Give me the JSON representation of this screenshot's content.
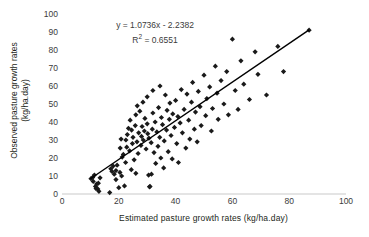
{
  "chart_data": {
    "type": "scatter",
    "title": "",
    "xlabel": "Estimated pasture growth rates (kg/ha.day)",
    "ylabel_line1": "Observed pasture growth rates",
    "ylabel_line2": "(kg/ha.day)",
    "xlim": [
      0,
      100
    ],
    "ylim": [
      0,
      100
    ],
    "xticks": [
      0,
      20,
      40,
      60,
      80,
      100
    ],
    "yticks": [
      0,
      10,
      20,
      30,
      40,
      50,
      60,
      70,
      80,
      90,
      100
    ],
    "grid": false,
    "legend": "none",
    "marker": "diamond",
    "marker_color": "#1a1a1a",
    "annotations": {
      "equation": "y = 1.0736x - 2.2382",
      "r_squared_prefix": "R",
      "r_squared_sup": "2",
      "r_squared_value": " = 0.6551"
    },
    "trendline": {
      "slope": 1.0736,
      "intercept": -2.2382,
      "x_start": 10,
      "x_end": 87,
      "color": "#000000",
      "width": 1.4
    },
    "points": [
      [
        10.2,
        8.5
      ],
      [
        10.8,
        9.2
      ],
      [
        11.0,
        7.0
      ],
      [
        11.4,
        10.5
      ],
      [
        11.8,
        4.2
      ],
      [
        12.0,
        3.0
      ],
      [
        12.2,
        5.5
      ],
      [
        12.6,
        2.8
      ],
      [
        12.8,
        6.0
      ],
      [
        13.0,
        1.5
      ],
      [
        13.4,
        9.0
      ],
      [
        16.8,
        0.8
      ],
      [
        17.2,
        14.0
      ],
      [
        17.6,
        12.5
      ],
      [
        18.0,
        15.5
      ],
      [
        18.4,
        11.0
      ],
      [
        19.0,
        13.0
      ],
      [
        19.4,
        16.0
      ],
      [
        20.0,
        3.5
      ],
      [
        20.4,
        12.0
      ],
      [
        20.8,
        30.5
      ],
      [
        21.2,
        20.5
      ],
      [
        21.6,
        22.0
      ],
      [
        22.0,
        4.5
      ],
      [
        22.4,
        17.5
      ],
      [
        22.8,
        26.0
      ],
      [
        23.0,
        33.0
      ],
      [
        23.4,
        36.5
      ],
      [
        23.8,
        24.0
      ],
      [
        24.0,
        41.0
      ],
      [
        24.4,
        13.5
      ],
      [
        24.8,
        28.0
      ],
      [
        25.0,
        31.5
      ],
      [
        25.4,
        19.0
      ],
      [
        25.8,
        38.0
      ],
      [
        26.0,
        44.0
      ],
      [
        26.4,
        29.0
      ],
      [
        26.8,
        22.5
      ],
      [
        27.0,
        34.0
      ],
      [
        27.4,
        46.0
      ],
      [
        27.8,
        27.0
      ],
      [
        28.0,
        32.0
      ],
      [
        28.2,
        37.5
      ],
      [
        28.6,
        30.0
      ],
      [
        29.0,
        35.0
      ],
      [
        29.2,
        42.0
      ],
      [
        29.6,
        25.0
      ],
      [
        30.0,
        39.0
      ],
      [
        30.2,
        33.5
      ],
      [
        30.6,
        31.0
      ],
      [
        30.8,
        4.0
      ],
      [
        31.0,
        4.2
      ],
      [
        31.4,
        28.5
      ],
      [
        31.8,
        36.0
      ],
      [
        32.0,
        45.0
      ],
      [
        32.4,
        23.0
      ],
      [
        32.8,
        40.0
      ],
      [
        33.0,
        17.0
      ],
      [
        33.4,
        34.5
      ],
      [
        33.8,
        26.5
      ],
      [
        34.0,
        48.0
      ],
      [
        34.4,
        31.5
      ],
      [
        34.8,
        20.0
      ],
      [
        35.0,
        42.5
      ],
      [
        35.4,
        38.5
      ],
      [
        35.8,
        14.5
      ],
      [
        36.0,
        29.5
      ],
      [
        36.4,
        55.0
      ],
      [
        36.8,
        35.5
      ],
      [
        37.0,
        46.5
      ],
      [
        37.4,
        23.5
      ],
      [
        37.8,
        41.5
      ],
      [
        38.0,
        50.5
      ],
      [
        38.4,
        32.5
      ],
      [
        38.8,
        19.5
      ],
      [
        39.0,
        44.5
      ],
      [
        39.6,
        37.0
      ],
      [
        40.0,
        52.0
      ],
      [
        40.4,
        28.0
      ],
      [
        40.8,
        43.0
      ],
      [
        41.0,
        17.5
      ],
      [
        41.6,
        39.5
      ],
      [
        42.0,
        58.0
      ],
      [
        42.4,
        34.0
      ],
      [
        43.0,
        47.0
      ],
      [
        43.6,
        25.5
      ],
      [
        44.0,
        55.5
      ],
      [
        44.6,
        41.0
      ],
      [
        45.0,
        30.5
      ],
      [
        45.6,
        51.0
      ],
      [
        46.0,
        62.0
      ],
      [
        46.6,
        36.0
      ],
      [
        47.0,
        45.5
      ],
      [
        47.6,
        29.0
      ],
      [
        48.0,
        57.0
      ],
      [
        48.6,
        48.5
      ],
      [
        49.0,
        38.0
      ],
      [
        50.0,
        66.0
      ],
      [
        50.6,
        43.5
      ],
      [
        51.0,
        53.0
      ],
      [
        52.0,
        59.5
      ],
      [
        52.6,
        35.0
      ],
      [
        53.0,
        47.5
      ],
      [
        54.0,
        71.0
      ],
      [
        54.6,
        56.0
      ],
      [
        55.0,
        41.5
      ],
      [
        56.0,
        63.0
      ],
      [
        57.0,
        50.0
      ],
      [
        58.0,
        68.0
      ],
      [
        58.6,
        44.0
      ],
      [
        60.0,
        86.0
      ],
      [
        61.0,
        57.5
      ],
      [
        62.0,
        47.0
      ],
      [
        63.0,
        74.0
      ],
      [
        64.0,
        61.0
      ],
      [
        66.0,
        52.5
      ],
      [
        68.0,
        79.0
      ],
      [
        69.0,
        66.5
      ],
      [
        72.0,
        55.0
      ],
      [
        76.0,
        82.0
      ],
      [
        78.0,
        68.0
      ],
      [
        87.0,
        91.0
      ],
      [
        30.0,
        54.0
      ],
      [
        32.0,
        57.5
      ],
      [
        34.5,
        60.0
      ],
      [
        28.5,
        51.0
      ],
      [
        26.5,
        49.0
      ],
      [
        24.5,
        35.5
      ],
      [
        22.5,
        30.0
      ],
      [
        20.5,
        25.5
      ],
      [
        19.0,
        8.0
      ],
      [
        21.0,
        10.0
      ],
      [
        26.0,
        11.5
      ],
      [
        30.5,
        10.5
      ],
      [
        31.5,
        11.0
      ]
    ]
  }
}
